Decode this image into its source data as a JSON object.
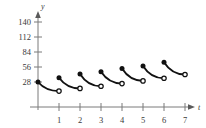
{
  "figure": {
    "background_color": "#ffffff"
  },
  "axes": {
    "y_axis_name": "y",
    "x_axis_name": "t",
    "axis_color": "#7a7a7a",
    "curve_color": "#111111"
  },
  "chart_data": {
    "type": "line",
    "title": "",
    "xlabel": "t",
    "ylabel": "y",
    "xlim": [
      0,
      7.6
    ],
    "ylim": [
      0,
      155
    ],
    "grid": false,
    "legend": null,
    "x_ticks": [
      1,
      2,
      3,
      4,
      5,
      6,
      7
    ],
    "x_tick_labels": [
      "1",
      "2",
      "3",
      "4",
      "5",
      "6",
      "7"
    ],
    "y_ticks": [
      28,
      56,
      84,
      112,
      140
    ],
    "y_tick_labels": [
      "28",
      "56",
      "84",
      "112",
      "140"
    ],
    "marker_legend": {
      "closed_circle": "included endpoint (start of interval)",
      "open_circle": "excluded endpoint (end of interval)"
    },
    "series": [
      {
        "name": "segment-1",
        "interval": [
          0,
          1
        ],
        "start_point": {
          "x": 0,
          "y": 28,
          "marker": "closed"
        },
        "end_point": {
          "x": 1,
          "y": 11,
          "marker": "open"
        }
      },
      {
        "name": "segment-2",
        "interval": [
          1,
          2
        ],
        "start_point": {
          "x": 1,
          "y": 36,
          "marker": "closed"
        },
        "end_point": {
          "x": 2,
          "y": 16,
          "marker": "open"
        }
      },
      {
        "name": "segment-3",
        "interval": [
          2,
          3
        ],
        "start_point": {
          "x": 2,
          "y": 43,
          "marker": "closed"
        },
        "end_point": {
          "x": 3,
          "y": 20,
          "marker": "open"
        }
      },
      {
        "name": "segment-4",
        "interval": [
          3,
          4
        ],
        "start_point": {
          "x": 3,
          "y": 47,
          "marker": "closed"
        },
        "end_point": {
          "x": 4,
          "y": 25,
          "marker": "open"
        }
      },
      {
        "name": "segment-5",
        "interval": [
          4,
          5
        ],
        "start_point": {
          "x": 4,
          "y": 53,
          "marker": "closed"
        },
        "end_point": {
          "x": 5,
          "y": 30,
          "marker": "open"
        }
      },
      {
        "name": "segment-6",
        "interval": [
          5,
          6
        ],
        "start_point": {
          "x": 5,
          "y": 58,
          "marker": "closed"
        },
        "end_point": {
          "x": 6,
          "y": 35,
          "marker": "open"
        }
      },
      {
        "name": "segment-7",
        "interval": [
          6,
          7
        ],
        "start_point": {
          "x": 6,
          "y": 65,
          "marker": "closed"
        },
        "end_point": {
          "x": 7,
          "y": 42,
          "marker": "open"
        }
      }
    ]
  }
}
